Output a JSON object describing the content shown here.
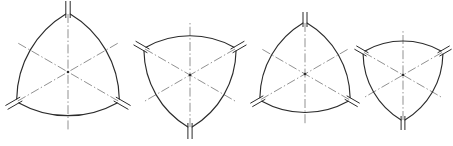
{
  "sheet": {
    "title": "Reuleaux triangle cam profile figures",
    "background_color": "#ffffff",
    "width": 453,
    "height": 146
  },
  "style": {
    "outline_color": "#2b2b2b",
    "centerline_color": "#8b8b8b",
    "outline_width": 1.15,
    "centerline_width": 0.95,
    "centerline_dash": "9 2.4 1.4 2.4"
  },
  "figures": [
    {
      "id": "figure-1",
      "label": "Figure 1",
      "center_x": 68,
      "center_y": 72,
      "radius": 58,
      "rotation_deg": 0,
      "slot_count": 3,
      "slot_length": 17,
      "slot_width": 4.4,
      "centerline_count": 6,
      "centerline_extent": 58
    },
    {
      "id": "figure-2",
      "label": "Figure 2",
      "center_x": 190,
      "center_y": 75,
      "radius": 52,
      "rotation_deg": 180,
      "slot_count": 3,
      "slot_length": 16,
      "slot_width": 4.2,
      "centerline_count": 6,
      "centerline_extent": 52
    },
    {
      "id": "figure-3",
      "label": "Figure 3",
      "center_x": 305,
      "center_y": 74,
      "radius": 51,
      "rotation_deg": 0,
      "slot_count": 3,
      "slot_length": 15,
      "slot_width": 4.0,
      "centerline_count": 6,
      "centerline_extent": 51
    },
    {
      "id": "figure-4",
      "label": "Figure 4",
      "center_x": 403,
      "center_y": 75,
      "radius": 45,
      "rotation_deg": 180,
      "slot_count": 3,
      "slot_length": 14,
      "slot_width": 3.8,
      "centerline_count": 6,
      "centerline_extent": 45
    }
  ]
}
